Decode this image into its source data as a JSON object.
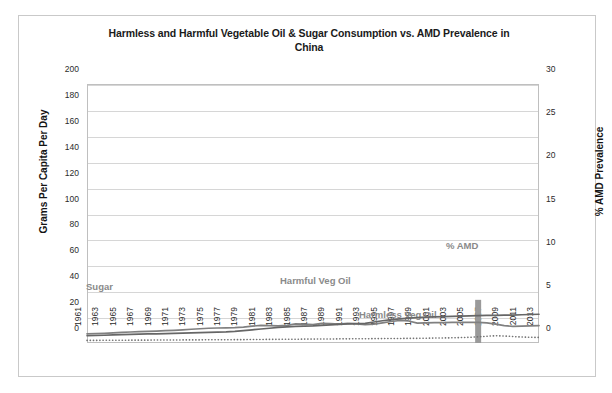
{
  "chart_data": {
    "type": "line",
    "title": "Harmless and Harmful Vegetable Oil & Sugar Consumption vs. AMD Prevalence in China",
    "title_line1": "Harmless and Harmful Vegetable Oil & Sugar Consumption vs. AMD Prevalence in",
    "title_line2": "China",
    "xlabel": "",
    "ylabel": "Grams Per Capita Per Day",
    "ylabel_secondary": "% AMD Prevalence",
    "ylim": [
      0,
      200
    ],
    "ylim_secondary": [
      0,
      30
    ],
    "yticks": [
      0,
      20,
      40,
      60,
      80,
      100,
      120,
      140,
      160,
      180,
      200
    ],
    "yticks_secondary": [
      0,
      5,
      10,
      15,
      20,
      25,
      30
    ],
    "grid": true,
    "legend_position": "inline-annotations",
    "x": [
      1961,
      1962,
      1963,
      1964,
      1965,
      1966,
      1967,
      1968,
      1969,
      1970,
      1971,
      1972,
      1973,
      1974,
      1975,
      1976,
      1977,
      1978,
      1979,
      1980,
      1981,
      1982,
      1983,
      1984,
      1985,
      1986,
      1987,
      1988,
      1989,
      1990,
      1991,
      1992,
      1993,
      1994,
      1995,
      1996,
      1997,
      1998,
      1999,
      2000,
      2001,
      2002,
      2003,
      2004,
      2005,
      2006,
      2007,
      2008,
      2009,
      2010,
      2011,
      2012,
      2013
    ],
    "xticks": [
      1961,
      1963,
      1965,
      1967,
      1969,
      1971,
      1973,
      1975,
      1977,
      1979,
      1981,
      1983,
      1985,
      1987,
      1989,
      1991,
      1993,
      1995,
      1997,
      1999,
      2001,
      2003,
      2005,
      2007,
      2009,
      2011,
      2013
    ],
    "series": [
      {
        "name": "Sugar",
        "style": "solid",
        "color": "#808080",
        "axis": "left",
        "values": [
          7.0,
          7.2,
          7.5,
          7.8,
          8.2,
          8.5,
          8.8,
          9.0,
          9.2,
          9.5,
          9.8,
          10.2,
          10.6,
          11.0,
          11.4,
          11.6,
          11.7,
          11.8,
          12.2,
          13.0,
          13.6,
          13.4,
          13.2,
          13.6,
          14.8,
          14.6,
          14.2,
          15.2,
          15.0,
          14.6,
          15.2,
          14.8,
          14.2,
          14.6,
          15.6,
          16.6,
          17.4,
          17.0,
          15.4,
          15.6,
          15.8,
          15.8,
          15.9,
          16.0,
          16.0,
          16.0,
          15.6,
          14.6,
          13.4,
          12.8,
          13.0,
          13.2,
          13.4
        ]
      },
      {
        "name": "Harmful Veg Oil",
        "style": "solid",
        "color": "#666666",
        "axis": "left",
        "values": [
          5.6,
          5.8,
          6.0,
          6.2,
          6.4,
          6.6,
          6.8,
          7.0,
          7.1,
          7.2,
          7.4,
          7.6,
          7.8,
          8.0,
          8.2,
          8.4,
          8.6,
          9.0,
          9.6,
          10.2,
          10.8,
          11.4,
          12.0,
          12.4,
          12.8,
          13.0,
          13.2,
          13.6,
          14.0,
          14.4,
          14.8,
          15.0,
          15.2,
          16.2,
          17.2,
          18.0,
          18.6,
          19.2,
          19.6,
          20.0,
          20.2,
          20.4,
          20.6,
          20.8,
          21.0,
          21.2,
          21.3,
          21.4,
          21.5,
          21.6,
          21.8,
          22.0,
          22.2
        ]
      },
      {
        "name": "Harmless Veg Oil",
        "style": "dotted",
        "color": "#737373",
        "axis": "left",
        "values": [
          2.0,
          2.0,
          2.1,
          2.1,
          2.1,
          2.2,
          2.2,
          2.2,
          2.3,
          2.3,
          2.3,
          2.4,
          2.4,
          2.4,
          2.5,
          2.5,
          2.5,
          2.6,
          2.6,
          2.7,
          2.7,
          2.8,
          2.8,
          2.9,
          2.9,
          3.0,
          3.0,
          3.1,
          3.1,
          3.2,
          3.2,
          3.3,
          3.3,
          3.4,
          3.4,
          3.5,
          3.5,
          3.6,
          3.6,
          3.7,
          3.8,
          3.9,
          4.0,
          4.2,
          4.4,
          4.8,
          5.2,
          5.6,
          5.4,
          5.0,
          4.6,
          4.4,
          4.3
        ]
      }
    ],
    "bar_series": [
      {
        "name": "% AMD",
        "color": "#9a9a9a",
        "axis": "right",
        "points": [
          {
            "x": 2006,
            "value": 5.0
          }
        ]
      }
    ],
    "annotations": [
      {
        "name": "sugar-label",
        "text": "Sugar",
        "x_px": 85,
        "y_px": 280
      },
      {
        "name": "harmful-veg-oil-label",
        "text": "Harmful Veg Oil",
        "x_px": 279,
        "y_px": 274
      },
      {
        "name": "harmless-veg-oil-label",
        "text": "Harmless Veg Oil",
        "x_px": 358,
        "y_px": 308
      },
      {
        "name": "amd-label",
        "text": "% AMD",
        "x_px": 445,
        "y_px": 239
      }
    ]
  }
}
